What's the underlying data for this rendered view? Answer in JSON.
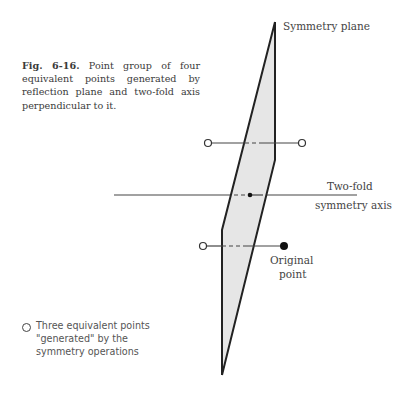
{
  "figure": {
    "number": "Fig. 6-16.",
    "caption": "Point group of four equivalent points generated by reflection plane and two-fold axis perpendicular to it."
  },
  "labels": {
    "plane": "Symmetry plane",
    "axis_line1": "Two-fold",
    "axis_line2": "symmetry axis",
    "original_line1": "Original",
    "original_line2": "point"
  },
  "legend": {
    "symbol": "open-circle",
    "text_line1": "Three equivalent points",
    "text_line2": "\"generated\" by the",
    "text_line3": "symmetry operations"
  },
  "colors": {
    "plane_fill": "#e6e6e6",
    "line": "#333333"
  }
}
